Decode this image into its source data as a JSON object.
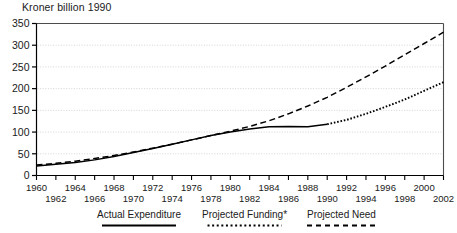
{
  "chart_data": {
    "type": "line",
    "title": "",
    "ylabel": "Kroner billion 1990",
    "xlabel": "",
    "ylim": [
      0,
      350
    ],
    "xlim": [
      1960,
      2002
    ],
    "yticks": [
      0,
      50,
      100,
      150,
      200,
      250,
      300,
      350
    ],
    "ytick_labels": [
      "0",
      "50",
      "100",
      "150",
      "200",
      "250",
      "300",
      "350"
    ],
    "xticks": [
      1960,
      1962,
      1964,
      1966,
      1968,
      1970,
      1972,
      1974,
      1976,
      1978,
      1980,
      1982,
      1984,
      1986,
      1988,
      1990,
      1992,
      1994,
      1996,
      1998,
      2000,
      2002
    ],
    "xtick_labels_row1": [
      "1960",
      "1964",
      "1968",
      "1972",
      "1976",
      "1980",
      "1984",
      "1988",
      "1992",
      "1996",
      "2000"
    ],
    "xtick_labels_row2": [
      "1962",
      "1966",
      "1970",
      "1974",
      "1978",
      "1982",
      "1986",
      "1990",
      "1994",
      "1998",
      "2002"
    ],
    "grid": true,
    "grid_axis": "y",
    "legend_position": "below",
    "series": [
      {
        "name": "Actual Expenditure",
        "style": "solid",
        "color": "#000000",
        "x": [
          1960,
          1962,
          1964,
          1966,
          1968,
          1970,
          1972,
          1974,
          1976,
          1978,
          1980,
          1982,
          1984,
          1986,
          1988,
          1990
        ],
        "values": [
          22,
          26,
          30,
          36,
          44,
          53,
          62,
          72,
          82,
          92,
          100,
          107,
          112,
          113,
          112,
          118
        ]
      },
      {
        "name": "Projected Funding*",
        "style": "dotted",
        "color": "#000000",
        "x": [
          1990,
          1992,
          1994,
          1996,
          1998,
          2000,
          2002
        ],
        "values": [
          118,
          128,
          142,
          158,
          175,
          195,
          215
        ]
      },
      {
        "name": "Projected Need",
        "style": "dashed",
        "color": "#000000",
        "x": [
          1960,
          1962,
          1964,
          1966,
          1968,
          1970,
          1972,
          1974,
          1976,
          1978,
          1980,
          1982,
          1984,
          1986,
          1988,
          1990,
          1992,
          1994,
          1996,
          1998,
          2000,
          2002
        ],
        "values": [
          24,
          28,
          33,
          39,
          46,
          54,
          63,
          72,
          82,
          92,
          102,
          113,
          126,
          142,
          160,
          180,
          203,
          227,
          252,
          278,
          304,
          330
        ]
      }
    ],
    "legend": [
      {
        "label": "Actual Expenditure",
        "style": "solid"
      },
      {
        "label": "Projected Funding*",
        "style": "dotted"
      },
      {
        "label": "Projected Need",
        "style": "dashed"
      }
    ]
  }
}
